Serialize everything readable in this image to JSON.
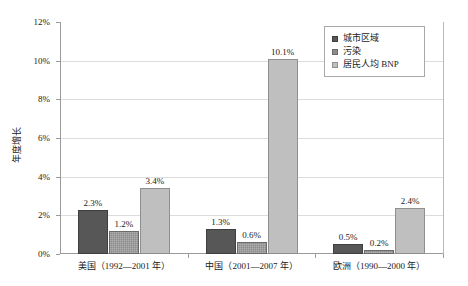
{
  "chart_data": {
    "type": "bar",
    "title": "",
    "xlabel": "",
    "ylabel": "年度增长",
    "ylim": [
      0,
      12
    ],
    "ytick_labels": [
      "0%",
      "2%",
      "4%",
      "6%",
      "8%",
      "10%",
      "12%"
    ],
    "ytick_values": [
      0,
      2,
      4,
      6,
      8,
      10,
      12
    ],
    "grid": true,
    "legend_position": "top-right",
    "categories": [
      "美国（1992—2001 年）",
      "中国（2001—2007 年）",
      "欧洲（1990—2000 年）"
    ],
    "series": [
      {
        "name": "城市区域",
        "color": "#575757",
        "values": [
          2.3,
          1.3,
          0.5
        ],
        "labels": [
          "2.3%",
          "1.3%",
          "0.5%"
        ]
      },
      {
        "name": "污染",
        "color": "#8c8c8c",
        "values": [
          1.2,
          0.6,
          0.2
        ],
        "labels": [
          "1.2%",
          "0.6%",
          "0.2%"
        ]
      },
      {
        "name": "居民人均 BNP",
        "color": "#bfbfbf",
        "values": [
          3.4,
          10.1,
          2.4
        ],
        "labels": [
          "3.4%",
          "10.1%",
          "2.4%"
        ]
      }
    ]
  }
}
